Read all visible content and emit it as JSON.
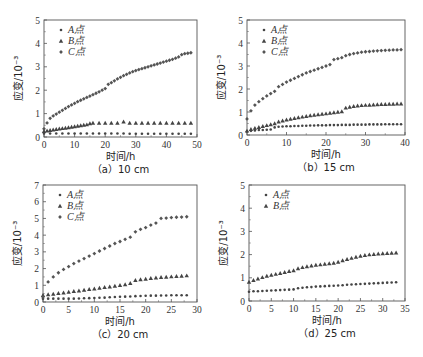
{
  "figure": {
    "panels": 4
  },
  "chart_data": [
    {
      "type": "scatter",
      "caption": "（a）10 cm",
      "xlabel": "时间/h",
      "ylabel": "应变/10⁻³",
      "xlim": [
        0,
        50
      ],
      "ylim": [
        0,
        5
      ],
      "xticks": [
        0,
        10,
        20,
        30,
        40,
        50
      ],
      "yticks": [
        0,
        1,
        2,
        3,
        4,
        5
      ],
      "legend_position": "top-left",
      "series": [
        {
          "name": "A点",
          "marker": "dot",
          "x": [
            0,
            2,
            4,
            6,
            8,
            10,
            12,
            14,
            16,
            18,
            20,
            22,
            24,
            26,
            28,
            30,
            32,
            34,
            36,
            38,
            40,
            42,
            44,
            46,
            48
          ],
          "y": [
            0.15,
            0.15,
            0.15,
            0.15,
            0.15,
            0.15,
            0.15,
            0.15,
            0.15,
            0.15,
            0.15,
            0.15,
            0.15,
            0.15,
            0.14,
            0.14,
            0.14,
            0.14,
            0.14,
            0.14,
            0.14,
            0.14,
            0.14,
            0.14,
            0.14
          ]
        },
        {
          "name": "B点",
          "marker": "triangle",
          "x": [
            0,
            1,
            2,
            3,
            4,
            5,
            6,
            7,
            8,
            9,
            10,
            11,
            12,
            13,
            14,
            15,
            16,
            18,
            20,
            22,
            24,
            26,
            28,
            30,
            32,
            34,
            36,
            38,
            40,
            42,
            44,
            46,
            48
          ],
          "y": [
            0.25,
            0.27,
            0.29,
            0.31,
            0.33,
            0.35,
            0.37,
            0.39,
            0.41,
            0.43,
            0.45,
            0.47,
            0.49,
            0.51,
            0.53,
            0.58,
            0.6,
            0.6,
            0.6,
            0.6,
            0.6,
            0.65,
            0.6,
            0.6,
            0.6,
            0.6,
            0.6,
            0.6,
            0.6,
            0.6,
            0.6,
            0.6,
            0.6
          ]
        },
        {
          "name": "C点",
          "marker": "diamond",
          "x": [
            0,
            1,
            2,
            3,
            4,
            5,
            6,
            7,
            8,
            9,
            10,
            11,
            12,
            13,
            14,
            15,
            16,
            17,
            18,
            19,
            20,
            21,
            22,
            23,
            24,
            25,
            26,
            27,
            28,
            29,
            30,
            31,
            32,
            33,
            34,
            35,
            36,
            37,
            38,
            39,
            40,
            41,
            42,
            43,
            44,
            45,
            46,
            47,
            48
          ],
          "y": [
            0.35,
            0.6,
            0.8,
            0.9,
            0.98,
            1.06,
            1.14,
            1.22,
            1.3,
            1.37,
            1.44,
            1.51,
            1.57,
            1.63,
            1.69,
            1.75,
            1.81,
            1.87,
            1.93,
            2.0,
            2.07,
            2.25,
            2.32,
            2.4,
            2.48,
            2.55,
            2.62,
            2.68,
            2.74,
            2.79,
            2.84,
            2.88,
            2.92,
            2.96,
            3.0,
            3.04,
            3.08,
            3.12,
            3.16,
            3.2,
            3.24,
            3.28,
            3.32,
            3.37,
            3.42,
            3.52,
            3.56,
            3.58,
            3.6
          ]
        }
      ]
    },
    {
      "type": "scatter",
      "caption": "（b）15 cm",
      "xlabel": "时间/h",
      "ylabel": "应变/10⁻³",
      "xlim": [
        0,
        40
      ],
      "ylim": [
        0,
        5
      ],
      "xticks": [
        0,
        10,
        20,
        30,
        40
      ],
      "yticks": [
        0,
        1,
        2,
        3,
        4,
        5
      ],
      "legend_position": "top-left",
      "series": [
        {
          "name": "A点",
          "marker": "dot",
          "x": [
            0,
            1,
            2,
            3,
            4,
            5,
            6,
            7,
            8,
            9,
            10,
            11,
            12,
            13,
            14,
            15,
            16,
            17,
            18,
            19,
            20,
            21,
            22,
            23,
            24,
            25,
            26,
            27,
            28,
            29,
            30,
            31,
            32,
            33,
            34,
            35,
            36,
            37,
            38,
            39
          ],
          "y": [
            0.15,
            0.18,
            0.2,
            0.22,
            0.22,
            0.23,
            0.24,
            0.33,
            0.36,
            0.37,
            0.38,
            0.38,
            0.39,
            0.39,
            0.4,
            0.4,
            0.41,
            0.41,
            0.42,
            0.42,
            0.42,
            0.43,
            0.43,
            0.43,
            0.44,
            0.44,
            0.44,
            0.45,
            0.45,
            0.45,
            0.45,
            0.46,
            0.46,
            0.46,
            0.46,
            0.47,
            0.47,
            0.47,
            0.47,
            0.47
          ]
        },
        {
          "name": "B点",
          "marker": "triangle",
          "x": [
            0,
            1,
            2,
            3,
            4,
            5,
            6,
            7,
            8,
            9,
            10,
            11,
            12,
            13,
            14,
            15,
            16,
            17,
            18,
            19,
            20,
            21,
            22,
            23,
            24,
            25,
            26,
            27,
            28,
            29,
            30,
            31,
            32,
            33,
            34,
            35,
            36,
            37,
            38,
            39
          ],
          "y": [
            0.18,
            0.25,
            0.3,
            0.34,
            0.38,
            0.42,
            0.46,
            0.5,
            0.58,
            0.62,
            0.66,
            0.7,
            0.73,
            0.76,
            0.79,
            0.82,
            0.85,
            0.87,
            0.89,
            0.91,
            0.93,
            0.96,
            0.98,
            1.0,
            1.02,
            1.18,
            1.22,
            1.25,
            1.27,
            1.29,
            1.3,
            1.31,
            1.32,
            1.33,
            1.34,
            1.34,
            1.35,
            1.35,
            1.36,
            1.36
          ]
        },
        {
          "name": "C点",
          "marker": "diamond",
          "x": [
            0,
            1,
            2,
            3,
            4,
            5,
            6,
            7,
            8,
            9,
            10,
            11,
            12,
            13,
            14,
            15,
            16,
            17,
            18,
            19,
            20,
            21,
            22,
            23,
            24,
            25,
            26,
            27,
            28,
            29,
            30,
            31,
            32,
            33,
            34,
            35,
            36,
            37,
            38,
            39
          ],
          "y": [
            0.7,
            1.05,
            1.3,
            1.45,
            1.58,
            1.7,
            1.8,
            1.9,
            2.1,
            2.2,
            2.3,
            2.38,
            2.46,
            2.54,
            2.62,
            2.7,
            2.76,
            2.82,
            2.88,
            2.94,
            3.0,
            3.06,
            3.28,
            3.32,
            3.36,
            3.45,
            3.5,
            3.54,
            3.57,
            3.6,
            3.62,
            3.63,
            3.65,
            3.66,
            3.67,
            3.68,
            3.69,
            3.7,
            3.7,
            3.71
          ]
        }
      ]
    },
    {
      "type": "scatter",
      "caption": "（c）20 cm",
      "xlabel": "时间/h",
      "ylabel": "应变/10⁻³",
      "xlim": [
        0,
        30
      ],
      "ylim": [
        0,
        7
      ],
      "xticks": [
        0,
        5,
        10,
        15,
        20,
        25,
        30
      ],
      "yticks": [
        0,
        1,
        2,
        3,
        4,
        5,
        6,
        7
      ],
      "legend_position": "top-left",
      "series": [
        {
          "name": "A点",
          "marker": "dot",
          "x": [
            0,
            1,
            2,
            3,
            4,
            5,
            6,
            7,
            8,
            9,
            10,
            11,
            12,
            13,
            14,
            15,
            16,
            17,
            18,
            19,
            20,
            21,
            22,
            23,
            24,
            25,
            26,
            27,
            28
          ],
          "y": [
            0.2,
            0.2,
            0.2,
            0.2,
            0.2,
            0.2,
            0.2,
            0.21,
            0.22,
            0.23,
            0.24,
            0.25,
            0.26,
            0.28,
            0.3,
            0.31,
            0.32,
            0.33,
            0.35,
            0.36,
            0.37,
            0.38,
            0.38,
            0.39,
            0.39,
            0.4,
            0.4,
            0.4,
            0.4
          ]
        },
        {
          "name": "B点",
          "marker": "triangle",
          "x": [
            0,
            1,
            2,
            3,
            4,
            5,
            6,
            7,
            8,
            9,
            10,
            11,
            12,
            13,
            14,
            15,
            16,
            17,
            18,
            19,
            20,
            21,
            22,
            23,
            24,
            25,
            26,
            27,
            28
          ],
          "y": [
            0.4,
            0.45,
            0.48,
            0.52,
            0.56,
            0.6,
            0.64,
            0.68,
            0.72,
            0.76,
            0.8,
            0.84,
            0.88,
            0.92,
            0.96,
            1.0,
            1.05,
            1.12,
            1.3,
            1.35,
            1.38,
            1.42,
            1.45,
            1.48,
            1.5,
            1.52,
            1.54,
            1.56,
            1.58
          ]
        },
        {
          "name": "C点",
          "marker": "diamond",
          "x": [
            0,
            1,
            2,
            3,
            4,
            5,
            6,
            7,
            8,
            9,
            10,
            11,
            12,
            13,
            14,
            15,
            16,
            17,
            18,
            19,
            20,
            21,
            22,
            23,
            24,
            25,
            26,
            27,
            28
          ],
          "y": [
            0.3,
            1.2,
            1.5,
            1.75,
            1.95,
            2.12,
            2.3,
            2.45,
            2.6,
            2.75,
            2.9,
            3.05,
            3.2,
            3.35,
            3.5,
            3.62,
            3.75,
            3.88,
            4.2,
            4.35,
            4.45,
            4.6,
            4.72,
            5.0,
            5.02,
            5.05,
            5.07,
            5.08,
            5.1
          ]
        }
      ]
    },
    {
      "type": "scatter",
      "caption": "（d）25 cm",
      "xlabel": "时间/h",
      "ylabel": "应变/10⁻³",
      "xlim": [
        0,
        35
      ],
      "ylim": [
        0,
        5
      ],
      "xticks": [
        0,
        5,
        10,
        15,
        20,
        25,
        30,
        35
      ],
      "yticks": [
        0,
        1,
        2,
        3,
        4,
        5
      ],
      "legend_position": "top-left",
      "series": [
        {
          "name": "A点",
          "marker": "dot",
          "x": [
            0,
            1,
            2,
            3,
            4,
            5,
            6,
            7,
            8,
            9,
            10,
            11,
            12,
            13,
            14,
            15,
            16,
            17,
            18,
            19,
            20,
            21,
            22,
            23,
            24,
            25,
            26,
            27,
            28,
            29,
            30,
            31,
            32,
            33
          ],
          "y": [
            0.4,
            0.42,
            0.42,
            0.43,
            0.44,
            0.45,
            0.46,
            0.47,
            0.48,
            0.49,
            0.5,
            0.55,
            0.57,
            0.59,
            0.6,
            0.62,
            0.63,
            0.64,
            0.65,
            0.66,
            0.67,
            0.68,
            0.7,
            0.71,
            0.72,
            0.73,
            0.74,
            0.75,
            0.76,
            0.77,
            0.78,
            0.79,
            0.8,
            0.81
          ]
        },
        {
          "name": "B点",
          "marker": "triangle",
          "x": [
            0,
            1,
            2,
            3,
            4,
            5,
            6,
            7,
            8,
            9,
            10,
            11,
            12,
            13,
            14,
            15,
            16,
            17,
            18,
            19,
            20,
            21,
            22,
            23,
            24,
            25,
            26,
            27,
            28,
            29,
            30,
            31,
            32,
            33
          ],
          "y": [
            0.82,
            0.9,
            0.96,
            1.02,
            1.08,
            1.12,
            1.16,
            1.2,
            1.24,
            1.28,
            1.32,
            1.4,
            1.45,
            1.49,
            1.52,
            1.55,
            1.57,
            1.6,
            1.62,
            1.64,
            1.68,
            1.75,
            1.8,
            1.85,
            1.9,
            1.94,
            1.97,
            2.0,
            2.02,
            2.04,
            2.05,
            2.06,
            2.07,
            2.08
          ]
        }
      ]
    }
  ]
}
